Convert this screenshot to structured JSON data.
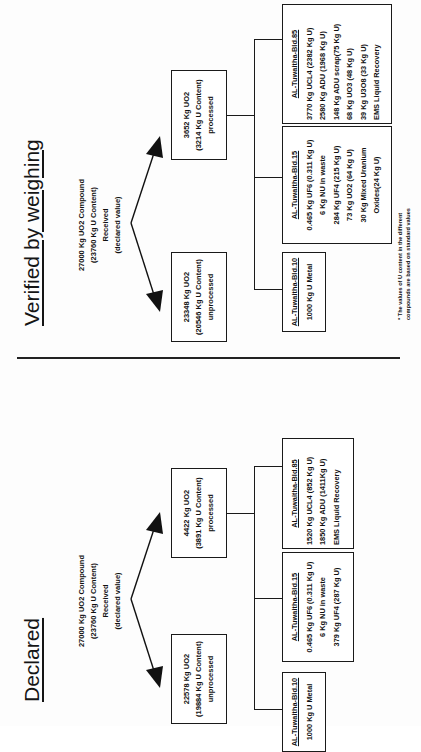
{
  "declared": {
    "title": "Declared",
    "source": {
      "line1": "27000 Kg UO2 Compound",
      "line2": "(23760 Kg U Content)",
      "line3": "Received",
      "line4": "(declared value)"
    },
    "unprocessed": {
      "line1": "22578 Kg UO2",
      "line2": "(19884 Kg U Content)",
      "line3": "unprocessed"
    },
    "processed": {
      "line1": "4422 Kg UO2",
      "line2": "(3891 Kg U Content)",
      "line3": "processed"
    },
    "buildings": [
      {
        "name": "AL-Tuwaitha-Bld.10",
        "lines": [
          "1000 Kg U Metal"
        ]
      },
      {
        "name": "AL-Tuwaitha-Bld.15",
        "lines": [
          "0.465 Kg UF6 (0.311 Kg U)",
          "6 Kg NU in waste",
          "379 Kg UF4 (287 Kg U)"
        ]
      },
      {
        "name": "AL-Tuwaitha-Bld.85",
        "lines": [
          "1520 Kg UCL4 (852 Kg U)",
          "1850 Kg ADU (1411Kg U)",
          "EMS Liquid Recovery"
        ]
      }
    ]
  },
  "verified": {
    "title": "Verified by weighing",
    "source": {
      "line1": "27000 Kg UO2 Compound",
      "line2": "(23760 Kg U Content)",
      "line3": "Received",
      "line4": "(declared value)"
    },
    "unprocessed": {
      "line1": "23348 Kg UO2",
      "line2": "(20546 Kg U Content)",
      "line3": "unprocessed"
    },
    "processed": {
      "line1": "3652 Kg UO2",
      "line2": "(3214 Kg U Content)",
      "line3": "processed"
    },
    "buildings": [
      {
        "name": "AL-Tuwaitha-Bld.10",
        "lines": [
          "1000 Kg U Metal"
        ]
      },
      {
        "name": "AL-Tuwaitha-Bld.15",
        "lines": [
          "0.465 Kg UF6 (0.311 Kg U)",
          "6 Kg NU in waste",
          "284 Kg UF4 (215 Kg U)",
          "73 Kg UO2 (64 Kg U)",
          "30 Kg Mixed Uranium",
          "Oxides(24 Kg U)"
        ]
      },
      {
        "name": "AL-Tuwaitha-Bld.85",
        "lines": [
          "3770 Kg UCL4 (2382 Kg U)",
          "2580 Kg ADU (1968 Kg U)",
          "148 Kg ADU scrap(75 Kg U)",
          "68 Kg UO3 (48 Kg U)",
          "39 Kg U3O8 (33 Kg U)",
          "EMS Liquid Recovery"
        ]
      }
    ],
    "footnote": "* The values of U content in the different compounds are based on standard values"
  }
}
